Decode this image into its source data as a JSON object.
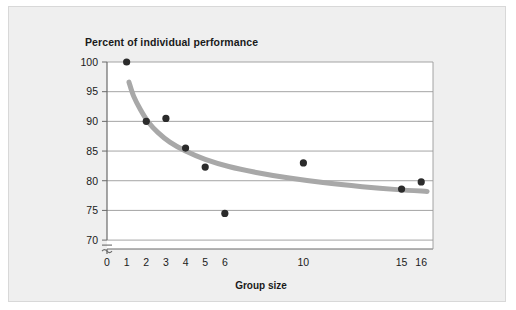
{
  "chart_data": {
    "type": "scatter",
    "title": "Percent of individual performance",
    "xlabel": "Group size",
    "ylabel": "",
    "xlim": [
      0,
      16.6
    ],
    "ylim": [
      68.5,
      100
    ],
    "grid": true,
    "axis_break": true,
    "axis_break_symbol": "≈",
    "legend": "none",
    "xticks": [
      0,
      1,
      2,
      3,
      4,
      5,
      6,
      10,
      15,
      16
    ],
    "xtick_labels": [
      "0",
      "1",
      "2",
      "3",
      "4",
      "5",
      "6",
      "10",
      "15",
      "16"
    ],
    "yticks": [
      70,
      75,
      80,
      85,
      90,
      95,
      100
    ],
    "ytick_labels": [
      "70",
      "75",
      "80",
      "85",
      "90",
      "95",
      "100"
    ],
    "x": [
      1,
      2,
      3,
      4,
      5,
      6,
      10,
      15,
      16
    ],
    "y": [
      100,
      90,
      90.5,
      85.5,
      82.3,
      74.5,
      83,
      78.6,
      79.8
    ],
    "points": [
      {
        "x": 1,
        "y": 100
      },
      {
        "x": 2,
        "y": 90
      },
      {
        "x": 3,
        "y": 90.5
      },
      {
        "x": 4,
        "y": 85.5
      },
      {
        "x": 5,
        "y": 82.3
      },
      {
        "x": 6,
        "y": 74.5
      },
      {
        "x": 10,
        "y": 83
      },
      {
        "x": 15,
        "y": 78.6
      },
      {
        "x": 16,
        "y": 79.8
      }
    ],
    "trend_curve": {
      "name": "fitted decay curve",
      "points": [
        {
          "x": 1.12,
          "y": 96.6
        },
        {
          "x": 1.35,
          "y": 94.3
        },
        {
          "x": 1.7,
          "y": 92.0
        },
        {
          "x": 2.1,
          "y": 89.9
        },
        {
          "x": 2.6,
          "y": 88.1
        },
        {
          "x": 3.2,
          "y": 86.5
        },
        {
          "x": 4.0,
          "y": 85.0
        },
        {
          "x": 5.0,
          "y": 83.6
        },
        {
          "x": 6.2,
          "y": 82.4
        },
        {
          "x": 7.6,
          "y": 81.4
        },
        {
          "x": 9.2,
          "y": 80.5
        },
        {
          "x": 11.0,
          "y": 79.7
        },
        {
          "x": 13.0,
          "y": 79.0
        },
        {
          "x": 14.8,
          "y": 78.5
        },
        {
          "x": 16.3,
          "y": 78.2
        }
      ]
    },
    "colors": {
      "point": "#2b2b2b",
      "curve": "#a8a8a8",
      "grid": "#9a9a9a",
      "axis": "#6a6a6a",
      "plot_background": "#ffffff",
      "figure_background": "#efefef",
      "text": "#1a1a1a"
    }
  }
}
